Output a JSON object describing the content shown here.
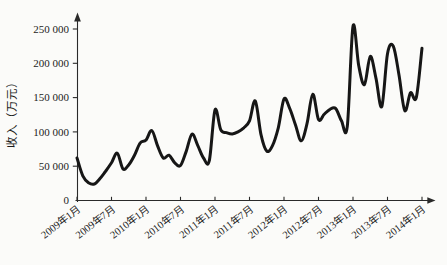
{
  "chart_data": {
    "type": "line",
    "title": "",
    "xlabel": "",
    "ylabel": "收入（万元）",
    "grid": false,
    "legend_position": "none",
    "ylim": [
      0,
      262000
    ],
    "y_ticks": [
      0,
      50000,
      100000,
      150000,
      200000,
      250000
    ],
    "y_tick_labels": [
      "0",
      "50 000",
      "100 000",
      "150 000",
      "200 000",
      "250 000"
    ],
    "x_tick_labels": [
      "2009年1月",
      "2009年7月",
      "2010年1月",
      "2010年7月",
      "2011年1月",
      "2011年7月",
      "2012年1月",
      "2012年7月",
      "2013年1月",
      "2013年7月",
      "2014年1月"
    ],
    "x_tick_month_indices": [
      0,
      6,
      12,
      18,
      24,
      30,
      36,
      42,
      48,
      54,
      60
    ],
    "x": [
      "2009-01",
      "2009-02",
      "2009-03",
      "2009-04",
      "2009-05",
      "2009-06",
      "2009-07",
      "2009-08",
      "2009-09",
      "2009-10",
      "2009-11",
      "2009-12",
      "2010-01",
      "2010-02",
      "2010-03",
      "2010-04",
      "2010-05",
      "2010-06",
      "2010-07",
      "2010-08",
      "2010-09",
      "2010-10",
      "2010-11",
      "2010-12",
      "2011-01",
      "2011-02",
      "2011-03",
      "2011-04",
      "2011-05",
      "2011-06",
      "2011-07",
      "2011-08",
      "2011-09",
      "2011-10",
      "2011-11",
      "2011-12",
      "2012-01",
      "2012-02",
      "2012-03",
      "2012-04",
      "2012-05",
      "2012-06",
      "2012-07",
      "2012-08",
      "2012-09",
      "2012-10",
      "2012-11",
      "2012-12",
      "2013-01",
      "2013-02",
      "2013-03",
      "2013-04",
      "2013-05",
      "2013-06",
      "2013-07",
      "2013-08",
      "2013-09",
      "2013-10",
      "2013-11",
      "2013-12",
      "2014-01"
    ],
    "series": [
      {
        "name": "收入",
        "color": "#161616",
        "values": [
          62000,
          36000,
          26000,
          24000,
          32000,
          43000,
          55000,
          69000,
          46000,
          52000,
          66000,
          84000,
          88000,
          102000,
          80000,
          62000,
          66000,
          55000,
          51000,
          72000,
          97000,
          80000,
          62000,
          58000,
          132000,
          103000,
          99000,
          97000,
          100000,
          106000,
          116000,
          145000,
          96000,
          72000,
          80000,
          106000,
          148000,
          134000,
          110000,
          87000,
          112000,
          155000,
          118000,
          126000,
          133000,
          134000,
          116000,
          108000,
          254000,
          196000,
          169000,
          210000,
          178000,
          137000,
          214000,
          225000,
          183000,
          131000,
          157000,
          150000,
          222000
        ]
      }
    ],
    "axis_color": "#2a2a2a",
    "background": "#fbfbf9"
  }
}
